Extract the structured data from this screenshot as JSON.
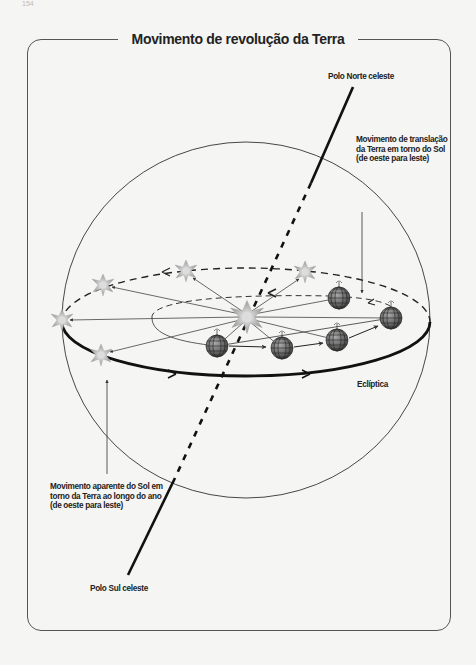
{
  "page": {
    "number": "154"
  },
  "diagram": {
    "title": "Movimento de revolução da Terra",
    "labels": {
      "north_pole": "Polo Norte celeste",
      "south_pole": "Polo Sul celeste",
      "ecliptic": "Eclíptica",
      "earth_translation": [
        "Movimento de translação",
        "da Terra em torno do Sol",
        "(de oeste para leste)"
      ],
      "sun_apparent": [
        "Movimento aparente do Sol em",
        "torno da Terra ao longo do ano",
        "(de oeste para leste)"
      ]
    },
    "elements": {
      "celestial_sphere": {
        "cx": 246,
        "cy": 320,
        "rx": 184,
        "ry": 178
      },
      "ecliptic_orbit": {
        "cx": 246,
        "cy": 322,
        "rx": 184,
        "ry": 54
      },
      "sun": {
        "x": 247,
        "y": 317
      },
      "apparent_sun_positions": [
        [
          62,
          320
        ],
        [
          103,
          285
        ],
        [
          186,
          271
        ],
        [
          305,
          272
        ],
        [
          101,
          355
        ]
      ],
      "earth_positions": [
        [
          217,
          346
        ],
        [
          282,
          348
        ],
        [
          337,
          340
        ],
        [
          339,
          298
        ],
        [
          391,
          318
        ]
      ]
    },
    "colors": {
      "line": "#222222",
      "frame": "#555555",
      "background": "#f5f5f3"
    }
  }
}
